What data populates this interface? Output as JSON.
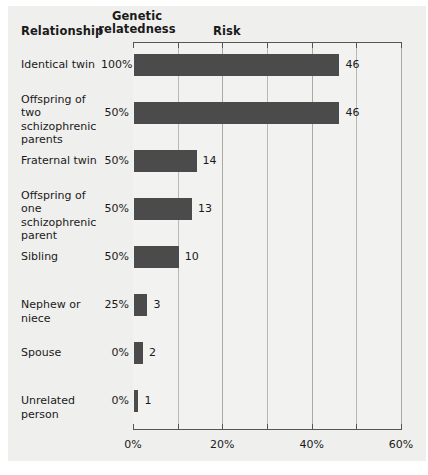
{
  "header": {
    "relationship": "Relationship",
    "genetic_relatedness_line1": "Genetic",
    "genetic_relatedness_line2": "relatedness",
    "risk": "Risk"
  },
  "colors": {
    "bar": "#4b4b4b",
    "panel_background": "#efefed",
    "plot_background": "#f2f2f0",
    "gridline": "#b8b8b4",
    "axis": "#555553",
    "text": "#1a1a1a"
  },
  "chart_data": {
    "type": "bar",
    "orientation": "horizontal",
    "title": "Risk",
    "xlabel": "",
    "ylabel": "Relationship",
    "xlim": [
      0,
      60
    ],
    "xticks": [
      0,
      20,
      40,
      60
    ],
    "xtick_labels": [
      "0%",
      "20%",
      "40%",
      "60%"
    ],
    "minor_xticks": [
      10,
      30,
      50
    ],
    "gridlines": [
      10,
      20,
      30,
      40,
      50,
      60
    ],
    "grid": true,
    "legend": "none",
    "value_suffix": "",
    "categories": [
      "Identical twin",
      "Offspring of two schizophrenic parents",
      "Fraternal twin",
      "Offspring of one schizophrenic parent",
      "Sibling",
      "Nephew or niece",
      "Spouse",
      "Unrelated person"
    ],
    "genetic_relatedness": [
      "100%",
      "50%",
      "50%",
      "50%",
      "50%",
      "25%",
      "0%",
      "0%"
    ],
    "values": [
      46,
      46,
      14,
      13,
      10,
      3,
      2,
      1
    ],
    "value_labels": [
      "46",
      "46",
      "14",
      "13",
      "10",
      "3",
      "2",
      "1"
    ]
  },
  "rows": [
    {
      "label_lines": [
        "Identical twin"
      ],
      "relatedness": "100%",
      "value": 46,
      "value_label": "46"
    },
    {
      "label_lines": [
        "Offspring of two",
        "schizophrenic",
        "parents"
      ],
      "relatedness": "50%",
      "value": 46,
      "value_label": "46"
    },
    {
      "label_lines": [
        "Fraternal twin"
      ],
      "relatedness": "50%",
      "value": 14,
      "value_label": "14"
    },
    {
      "label_lines": [
        "Offspring of one",
        "schizophrenic",
        "parent"
      ],
      "relatedness": "50%",
      "value": 13,
      "value_label": "13"
    },
    {
      "label_lines": [
        "Sibling"
      ],
      "relatedness": "50%",
      "value": 10,
      "value_label": "10"
    },
    {
      "label_lines": [
        "Nephew or niece"
      ],
      "relatedness": "25%",
      "value": 3,
      "value_label": "3"
    },
    {
      "label_lines": [
        "Spouse"
      ],
      "relatedness": "0%",
      "value": 2,
      "value_label": "2"
    },
    {
      "label_lines": [
        "Unrelated person"
      ],
      "relatedness": "0%",
      "value": 1,
      "value_label": "1"
    }
  ]
}
